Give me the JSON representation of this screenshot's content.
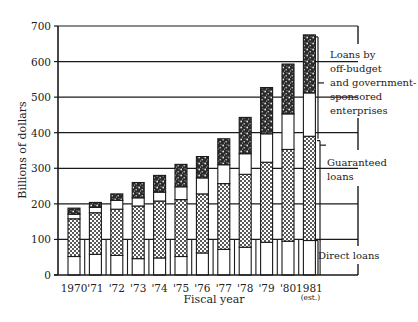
{
  "chart_data": {
    "type": "bar",
    "stacked": true,
    "title": "",
    "xlabel": "Fiscal year",
    "ylabel": "Billions of dollars",
    "ylim": [
      0,
      700
    ],
    "yticks": [
      0,
      100,
      200,
      300,
      400,
      500,
      600,
      700
    ],
    "grid": true,
    "categories": [
      "1970",
      "'71",
      "'72",
      "'73",
      "'74",
      "'75",
      "'76",
      "'77",
      "'78",
      "'79",
      "'80",
      "1981"
    ],
    "category_notes": {
      "1981": "(est.)"
    },
    "series": [
      {
        "name": "Direct loans",
        "pattern": "white",
        "values": [
          52,
          58,
          55,
          46,
          48,
          52,
          62,
          72,
          78,
          92,
          95,
          97
        ]
      },
      {
        "name": "Guaranteed loans",
        "pattern": "dotted",
        "values": [
          106,
          117,
          130,
          148,
          160,
          160,
          166,
          185,
          205,
          225,
          258,
          293
        ]
      },
      {
        "name": "Guaranteed loans (upper unshaded)",
        "pattern": "white",
        "values": [
          13,
          15,
          25,
          23,
          25,
          36,
          45,
          53,
          58,
          80,
          100,
          122
        ]
      },
      {
        "name": "Loans by off-budget and government-sponsored enterprises",
        "pattern": "dark-speckled",
        "values": [
          17,
          14,
          18,
          43,
          47,
          63,
          60,
          73,
          102,
          130,
          140,
          163
        ]
      }
    ],
    "totals": [
      188,
      204,
      228,
      260,
      280,
      311,
      333,
      383,
      443,
      527,
      593,
      675
    ],
    "legend": {
      "position": "right",
      "entries": [
        "Loans by off-budget and government-sponsored enterprises",
        "Guaranteed loans",
        "Direct loans"
      ]
    }
  },
  "axis": {
    "y_title": "Billions of dollars",
    "x_title": "Fiscal year",
    "y_ticks": [
      "0",
      "100",
      "200",
      "300",
      "400",
      "500",
      "600",
      "700"
    ],
    "x_ticks": [
      "1970",
      "'71",
      "'72",
      "'73",
      "'74",
      "'75",
      "'76",
      "'77",
      "'78",
      "'79",
      "'80",
      "1981"
    ],
    "x_note": "(est.)"
  },
  "legend": {
    "offbudget_lines": [
      "Loans by",
      "off-budget",
      "and government-",
      "sponsored",
      "enterprises"
    ],
    "guaranteed_lines": [
      "Guaranteed",
      "loans"
    ],
    "direct": "Direct loans"
  }
}
